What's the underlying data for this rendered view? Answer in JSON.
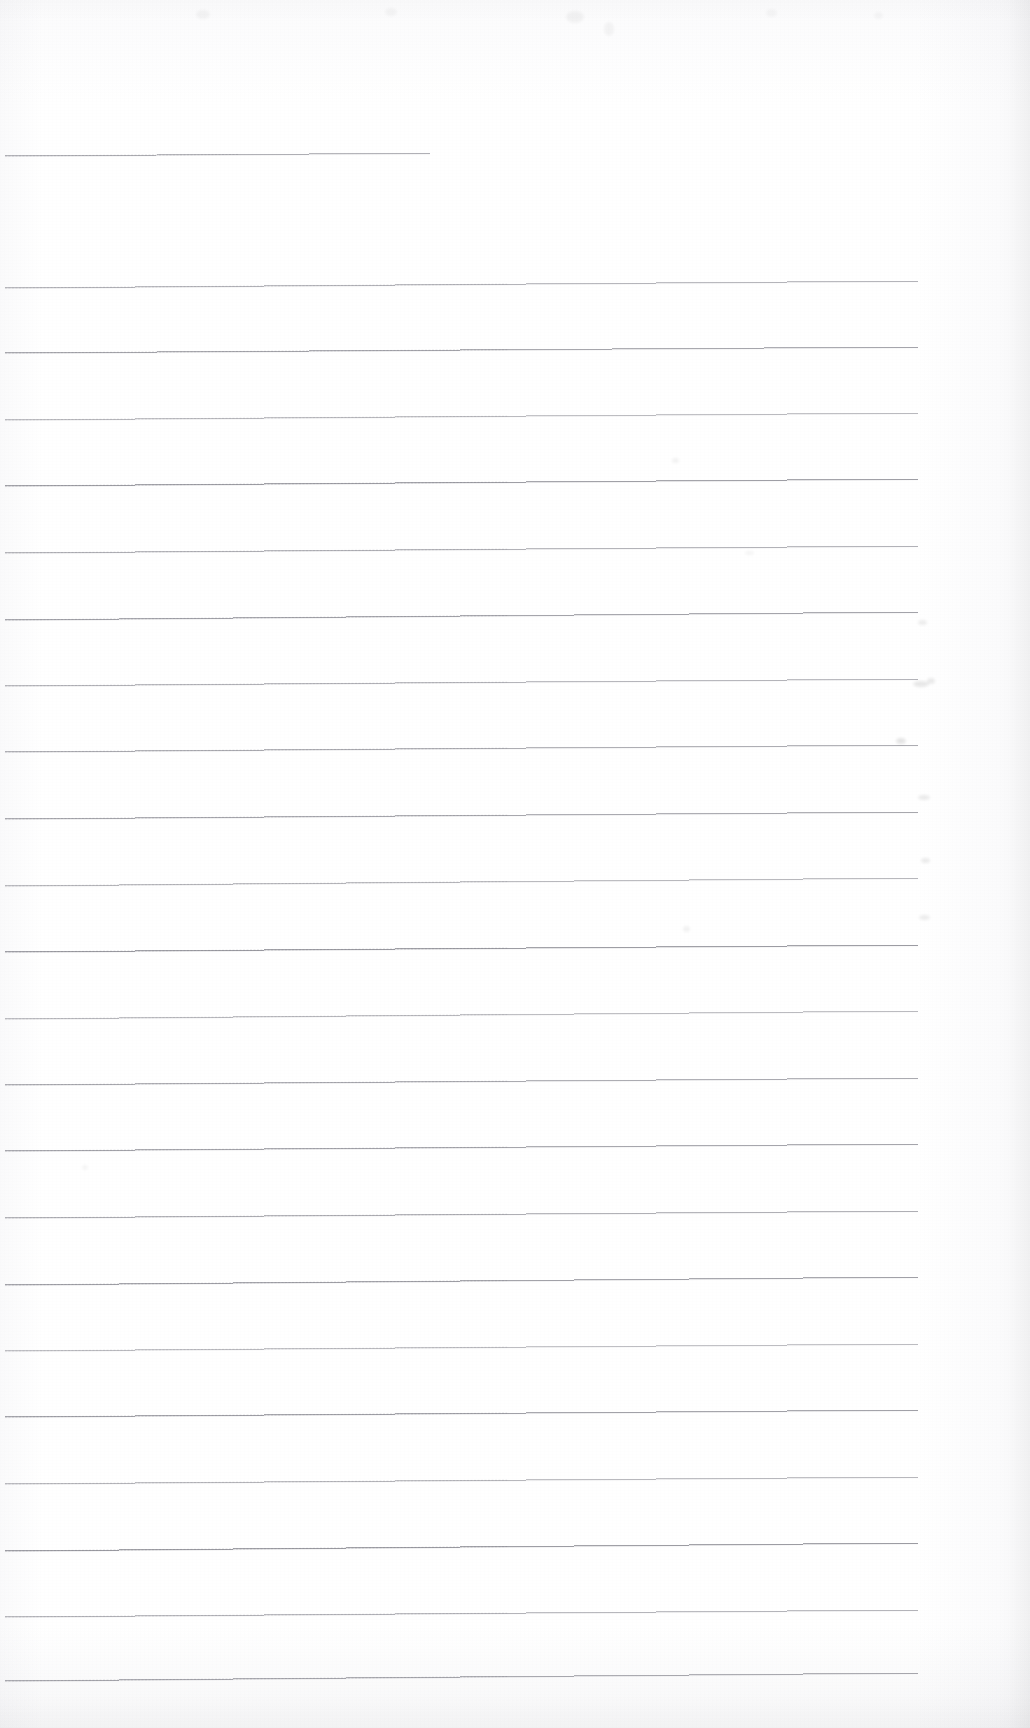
{
  "document": {
    "kind": "scanned-blank-ruled-paper",
    "page_width": 1030,
    "page_height": 1728,
    "background_color": "#fdfdfd",
    "visible_text": "",
    "has_handwriting": false,
    "has_printed_text": false
  },
  "ruling": {
    "line_color": "#7d7d86",
    "line_width_px": 1,
    "line_count": 23,
    "line_spacing_px": 66.7,
    "left_margin_x": 5,
    "right_end_x": 918,
    "tilt_degrees": -0.38,
    "notes": "Horizontal ruled lines tilt slightly upward toward the right; first line is short."
  },
  "lines": [
    {
      "index": 1,
      "y_left": 156,
      "y_right": 150,
      "x_start": 5,
      "x_end": 430,
      "weight": 0.55,
      "short": true
    },
    {
      "index": 2,
      "y_left": 288,
      "y_right": 281,
      "x_start": 5,
      "x_end": 918,
      "weight": 0.5,
      "short": false
    },
    {
      "index": 3,
      "y_left": 353,
      "y_right": 347,
      "x_start": 5,
      "x_end": 918,
      "weight": 0.62,
      "short": false
    },
    {
      "index": 4,
      "y_left": 420,
      "y_right": 413,
      "x_start": 5,
      "x_end": 918,
      "weight": 0.46,
      "short": false
    },
    {
      "index": 5,
      "y_left": 486,
      "y_right": 479,
      "x_start": 5,
      "x_end": 918,
      "weight": 0.68,
      "short": false
    },
    {
      "index": 6,
      "y_left": 553,
      "y_right": 546,
      "x_start": 5,
      "x_end": 918,
      "weight": 0.52,
      "short": false
    },
    {
      "index": 7,
      "y_left": 620,
      "y_right": 612,
      "x_start": 5,
      "x_end": 918,
      "weight": 0.64,
      "short": false
    },
    {
      "index": 8,
      "y_left": 686,
      "y_right": 679,
      "x_start": 5,
      "x_end": 918,
      "weight": 0.5,
      "short": false
    },
    {
      "index": 9,
      "y_left": 752,
      "y_right": 745,
      "x_start": 5,
      "x_end": 918,
      "weight": 0.56,
      "short": false
    },
    {
      "index": 10,
      "y_left": 819,
      "y_right": 812,
      "x_start": 5,
      "x_end": 918,
      "weight": 0.6,
      "short": false
    },
    {
      "index": 11,
      "y_left": 886,
      "y_right": 878,
      "x_start": 5,
      "x_end": 918,
      "weight": 0.48,
      "short": false
    },
    {
      "index": 12,
      "y_left": 952,
      "y_right": 945,
      "x_start": 5,
      "x_end": 918,
      "weight": 0.7,
      "short": false
    },
    {
      "index": 13,
      "y_left": 1019,
      "y_right": 1011,
      "x_start": 5,
      "x_end": 918,
      "weight": 0.46,
      "short": false
    },
    {
      "index": 14,
      "y_left": 1085,
      "y_right": 1078,
      "x_start": 5,
      "x_end": 918,
      "weight": 0.58,
      "short": false
    },
    {
      "index": 15,
      "y_left": 1151,
      "y_right": 1144,
      "x_start": 5,
      "x_end": 918,
      "weight": 0.62,
      "short": false
    },
    {
      "index": 16,
      "y_left": 1218,
      "y_right": 1211,
      "x_start": 5,
      "x_end": 918,
      "weight": 0.54,
      "short": false
    },
    {
      "index": 17,
      "y_left": 1285,
      "y_right": 1277,
      "x_start": 5,
      "x_end": 918,
      "weight": 0.66,
      "short": false
    },
    {
      "index": 18,
      "y_left": 1351,
      "y_right": 1344,
      "x_start": 5,
      "x_end": 918,
      "weight": 0.44,
      "short": false
    },
    {
      "index": 19,
      "y_left": 1417,
      "y_right": 1410,
      "x_start": 5,
      "x_end": 918,
      "weight": 0.66,
      "short": false
    },
    {
      "index": 20,
      "y_left": 1484,
      "y_right": 1477,
      "x_start": 5,
      "x_end": 918,
      "weight": 0.48,
      "short": false
    },
    {
      "index": 21,
      "y_left": 1551,
      "y_right": 1543,
      "x_start": 5,
      "x_end": 918,
      "weight": 0.7,
      "short": false
    },
    {
      "index": 22,
      "y_left": 1617,
      "y_right": 1610,
      "x_start": 5,
      "x_end": 918,
      "weight": 0.5,
      "short": false
    },
    {
      "index": 23,
      "y_left": 1681,
      "y_right": 1673,
      "x_start": 5,
      "x_end": 918,
      "weight": 0.6,
      "short": false
    }
  ],
  "artifacts": [
    {
      "name": "bleed-through-mark",
      "x": 918,
      "y": 620,
      "w": 9,
      "h": 5,
      "opacity": 0.07
    },
    {
      "name": "bleed-through-mark",
      "x": 913,
      "y": 681,
      "w": 16,
      "h": 6,
      "opacity": 0.09
    },
    {
      "name": "bleed-through-mark",
      "x": 927,
      "y": 678,
      "w": 8,
      "h": 6,
      "opacity": 0.08
    },
    {
      "name": "bleed-through-mark",
      "x": 896,
      "y": 738,
      "w": 10,
      "h": 6,
      "opacity": 0.1
    },
    {
      "name": "bleed-through-mark",
      "x": 918,
      "y": 795,
      "w": 12,
      "h": 5,
      "opacity": 0.08
    },
    {
      "name": "bleed-through-mark",
      "x": 921,
      "y": 858,
      "w": 9,
      "h": 5,
      "opacity": 0.08
    },
    {
      "name": "bleed-through-mark",
      "x": 919,
      "y": 915,
      "w": 11,
      "h": 5,
      "opacity": 0.07
    },
    {
      "name": "bleed-through-mark",
      "x": 672,
      "y": 458,
      "w": 7,
      "h": 5,
      "opacity": 0.05
    },
    {
      "name": "bleed-through-mark",
      "x": 745,
      "y": 551,
      "w": 9,
      "h": 4,
      "opacity": 0.04
    },
    {
      "name": "bleed-through-mark",
      "x": 683,
      "y": 926,
      "w": 7,
      "h": 6,
      "opacity": 0.05
    },
    {
      "name": "bleed-through-mark",
      "x": 82,
      "y": 1165,
      "w": 6,
      "h": 5,
      "opacity": 0.04
    },
    {
      "name": "ghost-text-mark",
      "x": 196,
      "y": 10,
      "w": 14,
      "h": 9,
      "opacity": 0.035
    },
    {
      "name": "ghost-text-mark",
      "x": 385,
      "y": 8,
      "w": 12,
      "h": 8,
      "opacity": 0.03
    },
    {
      "name": "ghost-text-mark",
      "x": 566,
      "y": 11,
      "w": 18,
      "h": 12,
      "opacity": 0.04
    },
    {
      "name": "ghost-text-mark",
      "x": 604,
      "y": 22,
      "w": 10,
      "h": 14,
      "opacity": 0.035
    },
    {
      "name": "ghost-text-mark",
      "x": 766,
      "y": 9,
      "w": 11,
      "h": 8,
      "opacity": 0.028
    },
    {
      "name": "ghost-text-mark",
      "x": 874,
      "y": 12,
      "w": 9,
      "h": 7,
      "opacity": 0.028
    }
  ]
}
